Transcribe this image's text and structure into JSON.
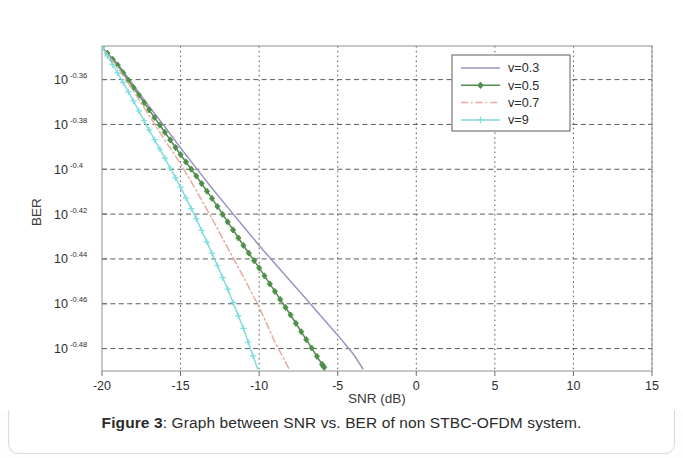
{
  "caption": {
    "figure_number": "Figure 3",
    "separator": ":",
    "text": "Graph between SNR vs. BER of non STBC-OFDM system."
  },
  "chart_data": {
    "type": "line",
    "title": "",
    "xlabel": "SNR (dB)",
    "ylabel": "BER",
    "xlim": [
      -20,
      15
    ],
    "ylim": [
      -0.49,
      -0.345
    ],
    "yscale": "log",
    "grid": true,
    "legend_position": "top-right",
    "xticks": [
      -20,
      -15,
      -10,
      -5,
      0,
      5,
      10,
      15
    ],
    "xtick_labels": [
      "-20",
      "-15",
      "-10",
      "-5",
      "0",
      "5",
      "10",
      "15"
    ],
    "yticks": [
      -0.36,
      -0.38,
      -0.4,
      -0.42,
      -0.44,
      -0.46,
      -0.48
    ],
    "ytick_labels": [
      {
        "base": "10",
        "exp": "-0.36"
      },
      {
        "base": "10",
        "exp": "-0.38"
      },
      {
        "base": "10",
        "exp": "-0.4"
      },
      {
        "base": "10",
        "exp": "-0.42"
      },
      {
        "base": "10",
        "exp": "-0.44"
      },
      {
        "base": "10",
        "exp": "-0.46"
      },
      {
        "base": "10",
        "exp": "-0.48"
      }
    ],
    "series": [
      {
        "name": "v=0.3",
        "color": "#9a93c4",
        "linestyle": "solid",
        "marker": "none",
        "x": [
          -20,
          -19,
          -18,
          -17,
          -16,
          -15,
          -14,
          -13,
          -12,
          -11,
          -10,
          -9,
          -8,
          -7,
          -6,
          -5,
          -4,
          -3.4
        ],
        "y": [
          -0.3455,
          -0.353,
          -0.3625,
          -0.372,
          -0.381,
          -0.3905,
          -0.3995,
          -0.4085,
          -0.417,
          -0.4255,
          -0.434,
          -0.442,
          -0.45,
          -0.458,
          -0.466,
          -0.474,
          -0.4825,
          -0.489
        ]
      },
      {
        "name": "v=0.5",
        "color": "#4e8f4a",
        "linestyle": "solid",
        "marker": "diamond",
        "x": [
          -20,
          -19,
          -18,
          -17,
          -16,
          -15,
          -14,
          -13,
          -12,
          -11,
          -10,
          -9,
          -8,
          -7,
          -6,
          -5.8
        ],
        "y": [
          -0.3455,
          -0.3535,
          -0.3635,
          -0.3735,
          -0.3835,
          -0.3935,
          -0.403,
          -0.413,
          -0.4235,
          -0.434,
          -0.444,
          -0.4545,
          -0.465,
          -0.476,
          -0.487,
          -0.489
        ]
      },
      {
        "name": "v=0.7",
        "color": "#e8a9a0",
        "linestyle": "dashdot",
        "marker": "none",
        "x": [
          -20,
          -19,
          -18,
          -17,
          -16,
          -15,
          -14,
          -13,
          -12,
          -11,
          -10,
          -9,
          -8.1
        ],
        "y": [
          -0.3455,
          -0.3545,
          -0.365,
          -0.376,
          -0.387,
          -0.3975,
          -0.4095,
          -0.422,
          -0.435,
          -0.448,
          -0.4615,
          -0.477,
          -0.489
        ]
      },
      {
        "name": "v=9",
        "color": "#7fdce0",
        "linestyle": "solid",
        "marker": "plus",
        "x": [
          -20,
          -19,
          -18,
          -17,
          -16,
          -15,
          -14,
          -13,
          -12,
          -11,
          -10.1
        ],
        "y": [
          -0.3455,
          -0.357,
          -0.3695,
          -0.3825,
          -0.395,
          -0.408,
          -0.422,
          -0.4375,
          -0.4535,
          -0.471,
          -0.489
        ]
      }
    ]
  }
}
